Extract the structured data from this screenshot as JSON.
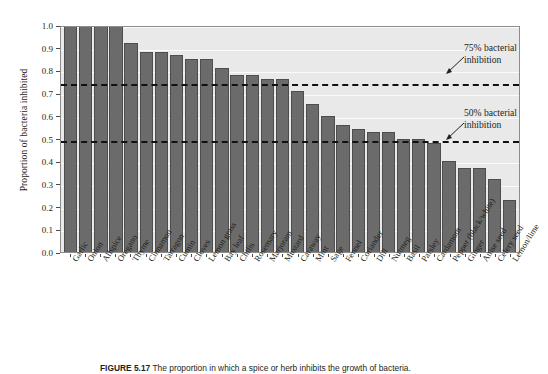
{
  "figure": {
    "caption_label": "FIGURE 5.17",
    "caption_text": "The proportion in which a spice or herb inhibits the growth of bacteria.",
    "y_axis_title": "Proportion of bacteria inhibited",
    "annotations": [
      {
        "id": "threshold-75",
        "text_line1": "75% bacterial",
        "text_line2": "inhibition",
        "value": 0.75
      },
      {
        "id": "threshold-50",
        "text_line1": "50% bacterial",
        "text_line2": "inhibition",
        "value": 0.5
      }
    ],
    "colors": {
      "bar_fill": "#6b6b6b",
      "bar_stroke": "#4d4d4d",
      "plot_background": "#e9e9e9",
      "gridline": "#fbfbfb",
      "threshold_line": "#111111",
      "text": "#231f20"
    }
  },
  "chart_data": {
    "type": "bar",
    "title": "",
    "xlabel": "",
    "ylabel": "Proportion of bacteria inhibited",
    "ylim": [
      0.0,
      1.0
    ],
    "grid": true,
    "legend": "none",
    "ytick_labels": [
      "1.0",
      "0.9",
      "0.8",
      "0.7",
      "0.6",
      "0.5",
      "0.4",
      "0.3",
      "0.2",
      "0.1",
      "0.0"
    ],
    "ytick_values": [
      1.0,
      0.9,
      0.8,
      0.7,
      0.6,
      0.5,
      0.4,
      0.3,
      0.2,
      0.1,
      0.0
    ],
    "reference_lines": [
      {
        "label": "75% bacterial inhibition",
        "value": 0.75,
        "style": "dashed"
      },
      {
        "label": "50% bacterial inhibition",
        "value": 0.5,
        "style": "dashed"
      }
    ],
    "categories": [
      "Garlic",
      "Onion",
      "Allspice",
      "Oregano",
      "Thyme",
      "Cinnamon",
      "Tarragon",
      "Cumin",
      "Cloves",
      "Lemon grass",
      "Bay leaf",
      "Chilis",
      "Rosemary",
      "Marjoram",
      "Mustard",
      "Caraway",
      "Mint",
      "Sage",
      "Fennel",
      "Coriander",
      "Dill",
      "Nutmeg",
      "Basil",
      "Parsley",
      "Cardamom",
      "Pepper (black/white)",
      "Ginger",
      "Anise seed",
      "Celery seed",
      "Lemon/lime"
    ],
    "values": [
      1.0,
      1.0,
      1.0,
      1.0,
      0.92,
      0.88,
      0.88,
      0.87,
      0.85,
      0.85,
      0.81,
      0.78,
      0.78,
      0.76,
      0.76,
      0.71,
      0.65,
      0.6,
      0.56,
      0.54,
      0.53,
      0.53,
      0.5,
      0.5,
      0.48,
      0.4,
      0.37,
      0.37,
      0.32,
      0.23
    ]
  }
}
